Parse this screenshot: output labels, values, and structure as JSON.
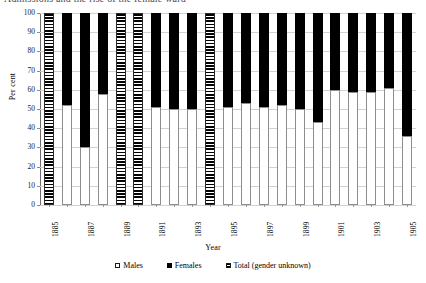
{
  "title_clipped": "Admissions and the rise of the female ward",
  "axes": {
    "ylabel": "Per cent",
    "xlabel": "Year",
    "yticks": [
      "0",
      "10",
      "20",
      "30",
      "40",
      "50",
      "60",
      "70",
      "80",
      "90",
      "100"
    ]
  },
  "legend": {
    "items": [
      {
        "label": "Males",
        "key": "males",
        "color": "#ffffff"
      },
      {
        "label": "Females",
        "key": "females",
        "color": "#000000"
      },
      {
        "label": "Total (gender unknown)",
        "key": "total",
        "color": "#000000"
      }
    ]
  },
  "chart_data": {
    "type": "bar",
    "title": "Admissions and the rise of the female ward",
    "xlabel": "Year",
    "ylabel": "Per cent",
    "ylim": [
      0,
      100
    ],
    "yticks": [
      0,
      10,
      20,
      30,
      40,
      50,
      60,
      70,
      80,
      90,
      100
    ],
    "grid": true,
    "stacked": true,
    "legend_position": "bottom",
    "categories": [
      "1885",
      "1886",
      "1887",
      "1888",
      "1889",
      "1890",
      "1891",
      "1892",
      "1893",
      "1894",
      "1895",
      "1896",
      "1897",
      "1898",
      "1899",
      "1900",
      "1901",
      "1902",
      "1903",
      "1904",
      "1905"
    ],
    "tick_labels": [
      "1885",
      "",
      "1887",
      "",
      "1889",
      "",
      "1891",
      "",
      "1893",
      "",
      "1895",
      "",
      "1897",
      "",
      "1899",
      "",
      "1901",
      "",
      "1903",
      "",
      "1905"
    ],
    "series": [
      {
        "name": "Males",
        "values": [
          null,
          52,
          30,
          58,
          null,
          null,
          51,
          50,
          50,
          null,
          51,
          53,
          51,
          52,
          50,
          43,
          60,
          59,
          59,
          61,
          36
        ]
      },
      {
        "name": "Females",
        "values": [
          null,
          48,
          70,
          42,
          null,
          null,
          49,
          50,
          50,
          null,
          49,
          47,
          49,
          48,
          50,
          57,
          40,
          41,
          41,
          39,
          64
        ]
      },
      {
        "name": "Total (gender unknown)",
        "values": [
          100,
          null,
          null,
          null,
          100,
          100,
          null,
          null,
          null,
          100,
          null,
          null,
          null,
          null,
          null,
          null,
          null,
          null,
          null,
          null,
          null
        ]
      }
    ]
  }
}
